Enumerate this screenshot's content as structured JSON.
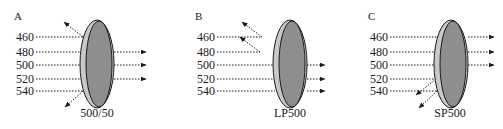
{
  "figure": {
    "panels": [
      {
        "id": "A",
        "label": "A",
        "filter_name": "500/50",
        "filter_type": "bandpass",
        "wavelengths": [
          "460",
          "480",
          "500",
          "520",
          "540"
        ],
        "transmitted": [
          "480",
          "500",
          "520"
        ],
        "reflected": [
          "460",
          "540"
        ]
      },
      {
        "id": "B",
        "label": "B",
        "filter_name": "LP500",
        "filter_type": "longpass",
        "wavelengths": [
          "460",
          "480",
          "500",
          "520",
          "540"
        ],
        "transmitted": [
          "500",
          "520",
          "540"
        ],
        "reflected": [
          "460",
          "480"
        ]
      },
      {
        "id": "C",
        "label": "C",
        "filter_name": "SP500",
        "filter_type": "shortpass",
        "wavelengths": [
          "460",
          "480",
          "500",
          "520",
          "540"
        ],
        "transmitted": [
          "460",
          "480",
          "500"
        ],
        "reflected": [
          "520",
          "540"
        ]
      }
    ],
    "colors": {
      "filter_rim": "#c8c8c8",
      "filter_face": "#8e8e8e",
      "ink": "#1a1a1a"
    }
  }
}
